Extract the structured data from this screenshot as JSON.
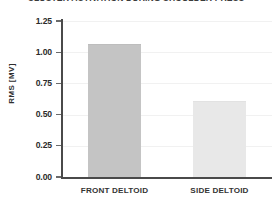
{
  "chart_data": {
    "type": "bar",
    "title": "CLUSTER ACTIVATION DURING SHOULDER PRESS",
    "xlabel": "",
    "ylabel": "RMS [MV]",
    "categories": [
      "FRONT DELTOID",
      "SIDE DELTOID"
    ],
    "values": [
      1.06,
      0.6
    ],
    "series": [
      {
        "name": "RMS [MV]",
        "values": [
          1.06,
          0.6
        ]
      }
    ],
    "ylim": [
      0.0,
      1.25
    ],
    "yticks": [
      0.0,
      0.25,
      0.5,
      0.75,
      1.0,
      1.25
    ],
    "ytick_labels": [
      "0.00",
      "0.25",
      "0.50",
      "0.75",
      "1.00",
      "1.25"
    ],
    "grid": true,
    "grid_axis": "y",
    "legend": false,
    "legend_position": "none",
    "bar_colors": [
      "#c4c4c4",
      "#e8e8e8"
    ],
    "bar_edge_colors": [
      "#bdbdbd",
      "#e2e2e2"
    ],
    "axis_color": "#4a4a4a",
    "grid_color": "#f1f1f1",
    "text_color": "#2b2b2b",
    "background_color": "#ffffff"
  }
}
